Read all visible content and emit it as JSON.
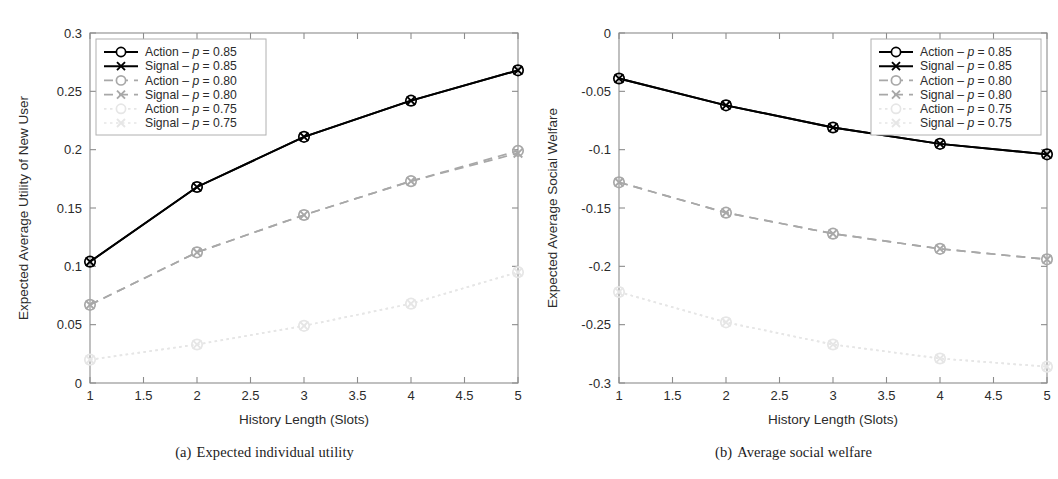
{
  "figure": {
    "panels": [
      {
        "id": "a",
        "caption_label": "(a)",
        "caption_text": "Expected individual utility"
      },
      {
        "id": "b",
        "caption_label": "(b)",
        "caption_text": "Average social welfare"
      }
    ]
  },
  "legend": {
    "entries": [
      {
        "label": "Action – p = 0.85",
        "name": "Action",
        "p": "0.85",
        "marker": "circle",
        "color": "#000000",
        "dash": "none"
      },
      {
        "label": "Signal – p = 0.85",
        "name": "Signal",
        "p": "0.85",
        "marker": "cross",
        "color": "#000000",
        "dash": "none"
      },
      {
        "label": "Action – p = 0.80",
        "name": "Action",
        "p": "0.80",
        "marker": "circle",
        "color": "#a8a8a8",
        "dash": "dashed"
      },
      {
        "label": "Signal – p = 0.80",
        "name": "Signal",
        "p": "0.80",
        "marker": "cross",
        "color": "#a8a8a8",
        "dash": "dashed"
      },
      {
        "label": "Action – p = 0.75",
        "name": "Action",
        "p": "0.75",
        "marker": "circle",
        "color": "#e6e6e6",
        "dash": "dotted"
      },
      {
        "label": "Signal – p = 0.75",
        "name": "Signal",
        "p": "0.75",
        "marker": "cross",
        "color": "#e6e6e6",
        "dash": "dotted"
      }
    ]
  },
  "chart_data": [
    {
      "type": "line",
      "panel": "a",
      "title": "Expected individual utility",
      "xlabel": "History Length (Slots)",
      "ylabel": "Expected Average Utility of New User",
      "x": [
        1,
        2,
        3,
        4,
        5
      ],
      "xlim": [
        1,
        5
      ],
      "ylim": [
        0,
        0.3
      ],
      "xticks": [
        1,
        1.5,
        2,
        2.5,
        3,
        3.5,
        4,
        4.5,
        5
      ],
      "xticklabels": [
        "1",
        "1.5",
        "2",
        "2.5",
        "3",
        "3.5",
        "4",
        "4.5",
        "5"
      ],
      "yticks": [
        0,
        0.05,
        0.1,
        0.15,
        0.2,
        0.25,
        0.3
      ],
      "yticklabels": [
        "0",
        "0.05",
        "0.1",
        "0.15",
        "0.2",
        "0.25",
        "0.3"
      ],
      "grid": false,
      "legend_position": "upper-left",
      "series": [
        {
          "name": "Action – p = 0.85",
          "color": "#000000",
          "dash": "none",
          "marker": "circle",
          "values": [
            0.104,
            0.168,
            0.211,
            0.242,
            0.268
          ]
        },
        {
          "name": "Signal – p = 0.85",
          "color": "#000000",
          "dash": "none",
          "marker": "cross",
          "values": [
            0.104,
            0.168,
            0.211,
            0.242,
            0.268
          ]
        },
        {
          "name": "Action – p = 0.80",
          "color": "#a8a8a8",
          "dash": "dashed",
          "marker": "circle",
          "values": [
            0.067,
            0.112,
            0.144,
            0.173,
            0.199
          ]
        },
        {
          "name": "Signal – p = 0.80",
          "color": "#a8a8a8",
          "dash": "dashed",
          "marker": "cross",
          "values": [
            0.067,
            0.112,
            0.144,
            0.173,
            0.197
          ]
        },
        {
          "name": "Action – p = 0.75",
          "color": "#e6e6e6",
          "dash": "dotted",
          "marker": "circle",
          "values": [
            0.02,
            0.033,
            0.049,
            0.068,
            0.095
          ]
        },
        {
          "name": "Signal – p = 0.75",
          "color": "#e6e6e6",
          "dash": "dotted",
          "marker": "cross",
          "values": [
            0.02,
            0.033,
            0.049,
            0.068,
            0.095
          ]
        }
      ]
    },
    {
      "type": "line",
      "panel": "b",
      "title": "Average social welfare",
      "xlabel": "History Length (Slots)",
      "ylabel": "Expected Average Social Welfare",
      "x": [
        1,
        2,
        3,
        4,
        5
      ],
      "xlim": [
        1,
        5
      ],
      "ylim": [
        -0.3,
        0
      ],
      "xticks": [
        1,
        1.5,
        2,
        2.5,
        3,
        3.5,
        4,
        4.5,
        5
      ],
      "xticklabels": [
        "1",
        "1.5",
        "2",
        "2.5",
        "3",
        "3.5",
        "4",
        "4.5",
        "5"
      ],
      "yticks": [
        -0.3,
        -0.25,
        -0.2,
        -0.15,
        -0.1,
        -0.05,
        0
      ],
      "yticklabels": [
        "-0.3",
        "-0.25",
        "-0.2",
        "-0.15",
        "-0.1",
        "-0.05",
        "0"
      ],
      "grid": false,
      "legend_position": "upper-right",
      "series": [
        {
          "name": "Action – p = 0.85",
          "color": "#000000",
          "dash": "none",
          "marker": "circle",
          "values": [
            -0.039,
            -0.062,
            -0.081,
            -0.095,
            -0.104
          ]
        },
        {
          "name": "Signal – p = 0.85",
          "color": "#000000",
          "dash": "none",
          "marker": "cross",
          "values": [
            -0.039,
            -0.062,
            -0.081,
            -0.095,
            -0.104
          ]
        },
        {
          "name": "Action – p = 0.80",
          "color": "#a8a8a8",
          "dash": "dashed",
          "marker": "circle",
          "values": [
            -0.128,
            -0.154,
            -0.172,
            -0.185,
            -0.194
          ]
        },
        {
          "name": "Signal – p = 0.80",
          "color": "#a8a8a8",
          "dash": "dashed",
          "marker": "cross",
          "values": [
            -0.128,
            -0.154,
            -0.172,
            -0.185,
            -0.194
          ]
        },
        {
          "name": "Action – p = 0.75",
          "color": "#e6e6e6",
          "dash": "dotted",
          "marker": "circle",
          "values": [
            -0.222,
            -0.248,
            -0.267,
            -0.279,
            -0.286
          ]
        },
        {
          "name": "Signal – p = 0.75",
          "color": "#e6e6e6",
          "dash": "dotted",
          "marker": "cross",
          "values": [
            -0.222,
            -0.248,
            -0.267,
            -0.279,
            -0.286
          ]
        }
      ]
    }
  ]
}
